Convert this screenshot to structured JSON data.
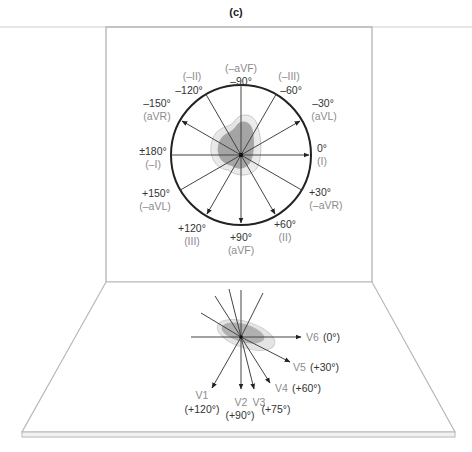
{
  "figure": {
    "panel_label": "(c)",
    "colors": {
      "frame": "#b8b8b8",
      "circle": "#222222",
      "axis_line": "#444444",
      "angle_text": "#333333",
      "lead_text": "#8c8c8c",
      "loop_fill_dark": "#9a9a9a",
      "loop_fill_light": "#cfcfcf"
    }
  },
  "frontal_plane": {
    "title": "Hexaxial reference system (frontal plane)",
    "axes": [
      {
        "angle": "-90°",
        "lead": "(–aVF)",
        "arrow": false
      },
      {
        "angle": "-60°",
        "lead": "(–III)",
        "arrow": false
      },
      {
        "angle": "-30°",
        "lead": "(aVL)",
        "arrow": true
      },
      {
        "angle": "0°",
        "lead": "(I)",
        "arrow": true
      },
      {
        "angle": "+30°",
        "lead": "(–aVR)",
        "arrow": false
      },
      {
        "angle": "+60°",
        "lead": "(II)",
        "arrow": true
      },
      {
        "angle": "+90°",
        "lead": "(aVF)",
        "arrow": true
      },
      {
        "angle": "+120°",
        "lead": "(III)",
        "arrow": true
      },
      {
        "angle": "+150°",
        "lead": "(–aVL)",
        "arrow": false
      },
      {
        "angle": "±180°",
        "lead": "(–I)",
        "arrow": false
      },
      {
        "angle": "–150°",
        "lead": "(aVR)",
        "arrow": true
      },
      {
        "angle": "–120°",
        "lead": "(–II)",
        "arrow": false
      }
    ],
    "labels": {
      "m90_angle": "–90°",
      "m90_lead": "(–aVF)",
      "m60_angle": "–60°",
      "m60_lead": "(–III)",
      "m30_angle": "–30°",
      "m30_lead": "(aVL)",
      "p0_angle": "0°",
      "p0_lead": "(I)",
      "p30_angle": "+30°",
      "p30_lead": "(–aVR)",
      "p60_angle": "+60°",
      "p60_lead": "(II)",
      "p90_angle": "+90°",
      "p90_lead": "(aVF)",
      "p120_angle": "+120°",
      "p120_lead": "(III)",
      "p150_angle": "+150°",
      "p150_lead": "(–aVL)",
      "p180_angle": "±180°",
      "p180_lead": "(–I)",
      "m150_angle": "–150°",
      "m150_lead": "(aVR)",
      "m120_angle": "–120°",
      "m120_lead": "(–II)"
    }
  },
  "horizontal_plane": {
    "title": "Precordial leads (horizontal plane)",
    "leads": [
      {
        "name": "V1",
        "angle": "(+120°)"
      },
      {
        "name": "V2",
        "angle": "(+90°)"
      },
      {
        "name": "V3",
        "angle": "(+75°)"
      },
      {
        "name": "V4",
        "angle": "(+60°)"
      },
      {
        "name": "V5",
        "angle": "(+30°)"
      },
      {
        "name": "V6",
        "angle": "(0°)"
      }
    ]
  }
}
